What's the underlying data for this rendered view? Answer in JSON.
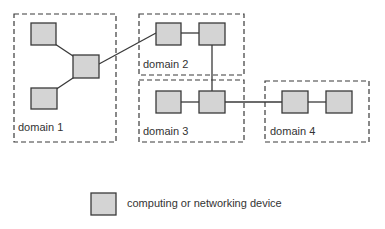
{
  "colors": {
    "node_fill": "#d4d4d4",
    "node_stroke": "#3a3a3a",
    "line": "#3a3a3a",
    "domain_border": "#3a3a3a",
    "text": "#333333"
  },
  "domains": [
    {
      "id": "domain-1",
      "label": "domain 1",
      "x": 14,
      "y": 14,
      "w": 102,
      "h": 128
    },
    {
      "id": "domain-2",
      "label": "domain 2",
      "x": 139,
      "y": 14,
      "w": 105,
      "h": 61
    },
    {
      "id": "domain-3",
      "label": "domain 3",
      "x": 139,
      "y": 80,
      "w": 105,
      "h": 62
    },
    {
      "id": "domain-4",
      "label": "domain 4",
      "x": 265,
      "y": 81,
      "w": 104,
      "h": 61
    }
  ],
  "nodes": [
    {
      "id": "d1-top",
      "domain": "domain 1",
      "x": 31,
      "y": 23,
      "w": 25,
      "h": 22
    },
    {
      "id": "d1-center",
      "domain": "domain 1",
      "x": 73,
      "y": 55,
      "w": 26,
      "h": 23
    },
    {
      "id": "d1-bottom",
      "domain": "domain 1",
      "x": 31,
      "y": 88,
      "w": 26,
      "h": 21
    },
    {
      "id": "d2-left",
      "domain": "domain 2",
      "x": 156,
      "y": 23,
      "w": 25,
      "h": 22
    },
    {
      "id": "d2-right",
      "domain": "domain 2",
      "x": 199,
      "y": 23,
      "w": 26,
      "h": 22
    },
    {
      "id": "d3-left",
      "domain": "domain 3",
      "x": 156,
      "y": 91,
      "w": 25,
      "h": 22
    },
    {
      "id": "d3-right",
      "domain": "domain 3",
      "x": 199,
      "y": 91,
      "w": 26,
      "h": 22
    },
    {
      "id": "d4-left",
      "domain": "domain 4",
      "x": 282,
      "y": 91,
      "w": 26,
      "h": 22
    },
    {
      "id": "d4-right",
      "domain": "domain 4",
      "x": 326,
      "y": 91,
      "w": 26,
      "h": 22
    }
  ],
  "links": [
    {
      "from": "d1-top",
      "to": "d1-center"
    },
    {
      "from": "d1-bottom",
      "to": "d1-center"
    },
    {
      "from": "d1-center",
      "to": "d2-left"
    },
    {
      "from": "d2-left",
      "to": "d2-right"
    },
    {
      "from": "d2-right",
      "to": "d3-right"
    },
    {
      "from": "d3-left",
      "to": "d3-right"
    },
    {
      "from": "d3-right",
      "to": "d4-left"
    },
    {
      "from": "d4-left",
      "to": "d4-right"
    }
  ],
  "legend": {
    "icon": "device-square-icon",
    "label": "computing or networking device"
  }
}
